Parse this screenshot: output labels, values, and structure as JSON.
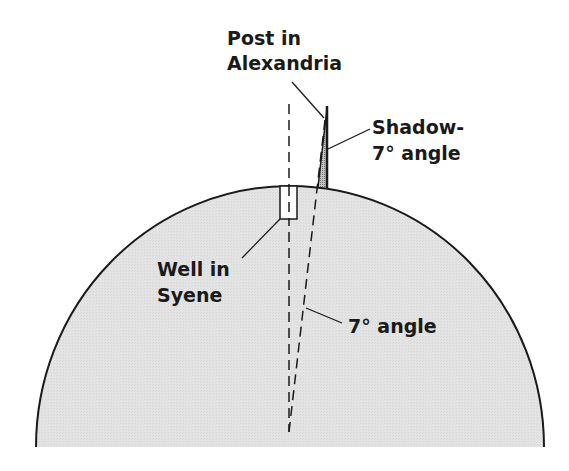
{
  "diagram": {
    "colors": {
      "earth_fill": "#e2e2e2",
      "line": "#1a1a1a",
      "background": "#ffffff",
      "shadow_fill": "#a9a9a9"
    },
    "labels": {
      "post_line1": "Post in",
      "post_line2": "Alexandria",
      "shadow_line1": "Shadow-",
      "shadow_line2": "7° angle",
      "well_line1": "Well in",
      "well_line2": "Syene",
      "center_angle": "7° angle"
    },
    "elements": [
      {
        "name": "earth-arc",
        "type": "semi-ellipse"
      },
      {
        "name": "well-in-syene",
        "type": "rectangle"
      },
      {
        "name": "post-in-alexandria",
        "type": "vertical line"
      },
      {
        "name": "shadow",
        "type": "triangle"
      },
      {
        "name": "vertical-ray-through-syene",
        "type": "dashed line"
      },
      {
        "name": "ray-through-alexandria",
        "type": "dashed line"
      }
    ]
  }
}
